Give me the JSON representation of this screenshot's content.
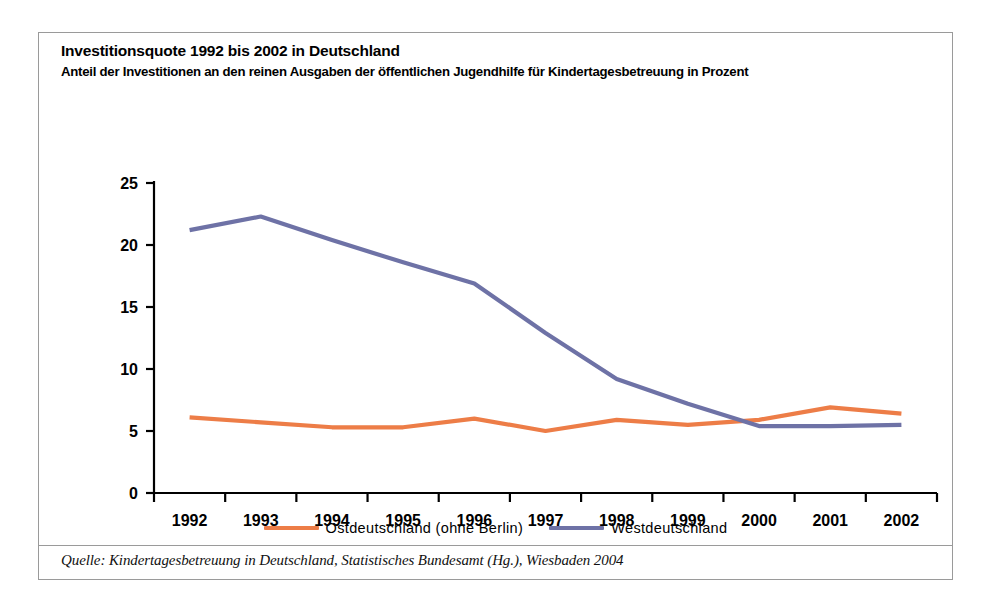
{
  "chart_title": "Investitionsquote 1992 bis 2002 in Deutschland",
  "chart_subtitle": "Anteil der Investitionen an den reinen Ausgaben der öffentlichen Jugendhilfe für Kindertagesbetreuung in Prozent",
  "source_note": "Quelle: Kindertagesbetreuung in Deutschland, Statistisches Bundesamt (Hg.), Wiesbaden 2004",
  "colors": {
    "ostdeutschland": "#ED7D47",
    "westdeutschland": "#6E72A6",
    "axis": "#000000",
    "frame": "#9a9a9a",
    "background": "#ffffff"
  },
  "legend": {
    "position": "bottom-center",
    "entries": [
      {
        "label": "Ostdeutschland (ohne Berlin)",
        "color": "#ED7D47"
      },
      {
        "label": "Westdeutschland",
        "color": "#6E72A6"
      }
    ]
  },
  "chart_data": {
    "type": "line",
    "title": "Investitionsquote 1992 bis 2002 in Deutschland",
    "subtitle": "Anteil der Investitionen an den reinen Ausgaben der öffentlichen Jugendhilfe für Kindertagesbetreuung in Prozent",
    "xlabel": "",
    "ylabel": "",
    "categories": [
      "1992",
      "1993",
      "1994",
      "1995",
      "1996",
      "1997",
      "1998",
      "1999",
      "2000",
      "2001",
      "2002"
    ],
    "x": [
      1992,
      1993,
      1994,
      1995,
      1996,
      1997,
      1998,
      1999,
      2000,
      2001,
      2002
    ],
    "ylim": [
      0,
      25
    ],
    "yticks": [
      0,
      5,
      10,
      15,
      20,
      25
    ],
    "ytick_labels": [
      "0",
      "5",
      "10",
      "15",
      "20",
      "25"
    ],
    "grid": false,
    "legend_position": "bottom-center",
    "series": [
      {
        "name": "Ostdeutschland (ohne Berlin)",
        "color": "#ED7D47",
        "values": [
          6.1,
          5.7,
          5.3,
          5.3,
          6.0,
          5.0,
          5.9,
          5.5,
          5.9,
          6.9,
          6.4
        ]
      },
      {
        "name": "Westdeutschland",
        "color": "#6E72A6",
        "values": [
          21.2,
          22.3,
          20.4,
          18.6,
          16.9,
          12.9,
          9.2,
          7.2,
          5.4,
          5.4,
          5.5
        ]
      }
    ]
  }
}
